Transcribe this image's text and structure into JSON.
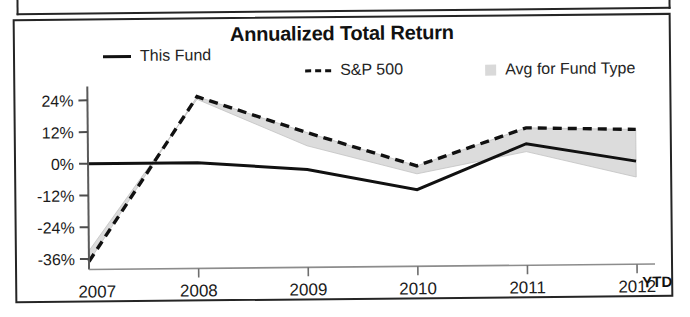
{
  "panel": {
    "title": "Annualized Total Return"
  },
  "legend": {
    "items": [
      {
        "label": "This Fund",
        "swatch": "solid-line-swatch",
        "color": "#111111"
      },
      {
        "label": "S&P 500",
        "swatch": "dashed-line-swatch",
        "color": "#111111"
      },
      {
        "label": "Avg for Fund Type",
        "swatch": "gray-box-swatch",
        "color": "#d9d9d9"
      }
    ]
  },
  "axis": {
    "x_suffix_label": "YTD",
    "y_ticks": [
      "24%",
      "12%",
      "0%",
      "-12%",
      "-24%",
      "-36%"
    ],
    "x_ticks": [
      "2007",
      "2008",
      "2009",
      "2010",
      "2011",
      "2012"
    ]
  },
  "chart_data": {
    "type": "line",
    "title": "Annualized Total Return",
    "xlabel": "",
    "ylabel": "",
    "categories": [
      "2007",
      "2008",
      "2009",
      "2010",
      "2011",
      "2012"
    ],
    "x_axis_note": "2012 is YTD",
    "ylim": [
      -40,
      30
    ],
    "y_ticks": [
      24,
      12,
      0,
      -12,
      -24,
      -36
    ],
    "grid": false,
    "legend_position": "top",
    "series": [
      {
        "name": "This Fund",
        "style": "solid",
        "color": "#111111",
        "values": [
          0,
          0,
          -3,
          -11,
          6,
          -1
        ]
      },
      {
        "name": "S&P 500",
        "style": "dashed",
        "color": "#111111",
        "values": [
          -37,
          25,
          11,
          -2,
          12,
          11
        ]
      },
      {
        "name": "Avg for Fund Type",
        "style": "shaded-band",
        "color": "#d9d9d9",
        "values": [
          -33,
          24,
          6,
          -5,
          3,
          -7
        ]
      }
    ]
  }
}
